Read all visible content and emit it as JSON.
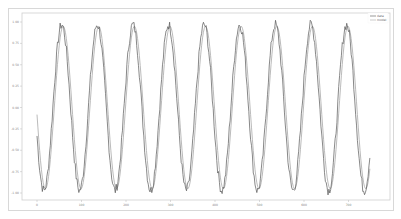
{
  "chart_data": {
    "type": "line",
    "title": "",
    "xlabel": "",
    "ylabel": "",
    "xlim": [
      -20,
      800
    ],
    "ylim": [
      -1.1,
      1.1
    ],
    "grid": false,
    "legend_position": "upper right",
    "xticks": [
      0,
      100,
      200,
      300,
      400,
      500,
      600,
      700
    ],
    "xtick_labels": [
      "0",
      "100",
      "200",
      "300",
      "400",
      "500",
      "600",
      "700"
    ],
    "yticks": [
      1.0,
      0.75,
      0.5,
      0.25,
      0.0,
      -0.25,
      -0.5,
      -0.75,
      -1.0
    ],
    "ytick_labels": [
      "1.00",
      "0.75",
      "0.50",
      "0.25",
      "0.00",
      "-0.25",
      "-0.50",
      "-0.75",
      "-1.00"
    ],
    "series": [
      {
        "name": "data",
        "color": "#555555",
        "noisy": true,
        "amplitude": 0.97,
        "period": 80,
        "phase_deg": 200,
        "x_range": [
          0,
          749
        ]
      },
      {
        "name": "model",
        "color": "#aaaaaa",
        "noisy": false,
        "amplitude": 0.95,
        "period": 80,
        "phase_deg": 185,
        "x_range": [
          0,
          749
        ]
      }
    ],
    "sample_points": {
      "x": [
        0,
        20,
        40,
        60,
        80,
        100,
        120,
        140,
        160,
        180,
        200,
        220,
        240,
        260,
        280,
        300,
        320,
        340,
        360,
        380,
        400,
        420,
        440,
        460,
        480,
        500,
        520,
        540,
        560,
        580,
        600,
        620,
        640,
        660,
        680,
        700,
        720,
        740
      ],
      "data": [
        -0.33,
        -0.94,
        0.33,
        0.94,
        -0.33,
        -0.94,
        0.33,
        0.94,
        -0.33,
        -0.94,
        0.33,
        0.94,
        -0.33,
        -0.94,
        0.33,
        0.94,
        -0.33,
        -0.94,
        0.33,
        0.94,
        -0.33,
        -0.94,
        0.33,
        0.94,
        -0.33,
        -0.94,
        0.33,
        0.94,
        -0.33,
        -0.94,
        0.33,
        0.94,
        -0.33,
        -0.94,
        0.33,
        0.94,
        -0.33,
        -0.94
      ],
      "model": [
        -0.08,
        -0.99,
        0.08,
        0.99,
        -0.08,
        -0.99,
        0.08,
        0.99,
        -0.08,
        -0.99,
        0.08,
        0.99,
        -0.08,
        -0.99,
        0.08,
        0.99,
        -0.08,
        -0.99,
        0.08,
        0.99,
        -0.08,
        -0.99,
        0.08,
        0.99,
        -0.08,
        -0.99,
        0.08,
        0.99,
        -0.08,
        -0.99,
        0.08,
        0.99,
        -0.08,
        -0.99,
        0.08,
        0.99,
        -0.08,
        -0.99
      ]
    }
  },
  "legend": {
    "items": [
      {
        "label": "data",
        "color": "#555555"
      },
      {
        "label": "model",
        "color": "#aaaaaa"
      }
    ]
  }
}
